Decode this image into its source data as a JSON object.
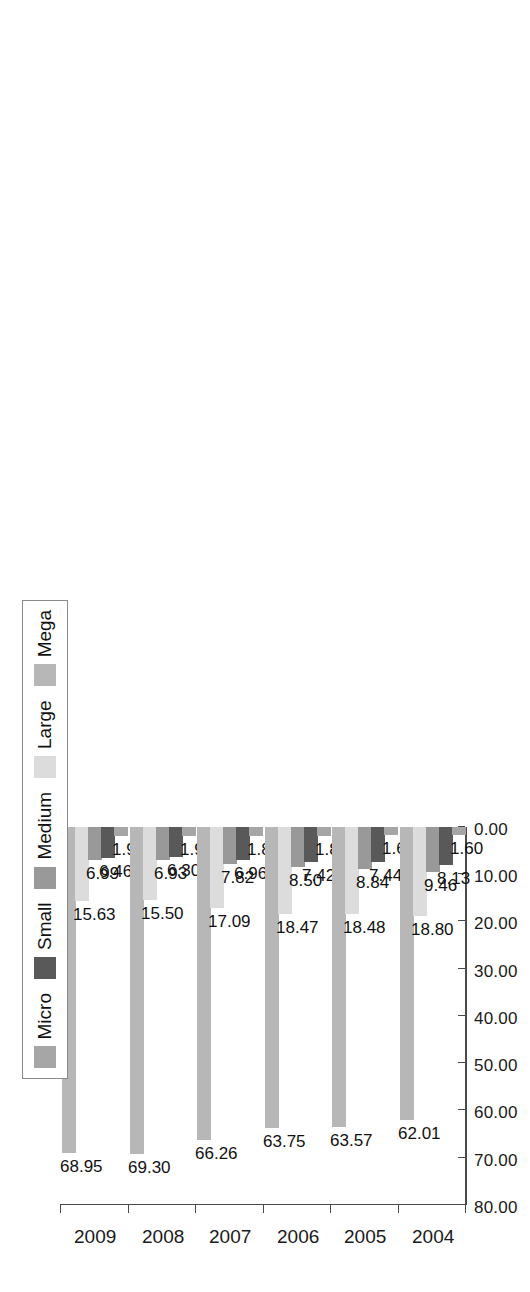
{
  "chart_data": {
    "type": "bar",
    "orientation": "horizontal",
    "title": "",
    "subtitle": "",
    "xlabel": "",
    "ylabel": "",
    "categories": [
      "2004",
      "2005",
      "2006",
      "2007",
      "2008",
      "2009"
    ],
    "category_order_top_to_bottom": [
      "2009",
      "2008",
      "2007",
      "2006",
      "2005",
      "2004"
    ],
    "series": [
      {
        "name": "Micro",
        "color": "#a6a6a6",
        "values": [
          1.6,
          1.66,
          1.87,
          1.88,
          1.96,
          1.97
        ]
      },
      {
        "name": "Small",
        "color": "#595959",
        "values": [
          8.13,
          7.44,
          7.42,
          6.96,
          6.3,
          6.46
        ]
      },
      {
        "name": "Medium",
        "color": "#999999",
        "values": [
          9.46,
          8.84,
          8.5,
          7.82,
          6.93,
          6.99
        ]
      },
      {
        "name": "Large",
        "color": "#dcdcdc",
        "values": [
          18.8,
          18.48,
          18.47,
          17.09,
          15.5,
          15.63
        ]
      },
      {
        "name": "Mega",
        "color": "#b7b7b7",
        "values": [
          62.01,
          63.57,
          63.75,
          66.26,
          69.3,
          68.95
        ]
      }
    ],
    "value_axis": {
      "min": 0,
      "max": 80,
      "step": 10,
      "tick_labels": [
        "80.00",
        "70.00",
        "60.00",
        "50.00",
        "40.00",
        "30.00",
        "20.00",
        "10.00",
        "0.00"
      ],
      "tick_values": [
        80,
        70,
        60,
        50,
        40,
        30,
        20,
        10,
        0
      ],
      "direction": "decreasing-left-to-right"
    },
    "grid": false,
    "data_labels": true,
    "data_label_format": "0.00",
    "legend": {
      "position": "left-outside",
      "entries": [
        "Micro",
        "Small",
        "Medium",
        "Large",
        "Mega"
      ]
    }
  }
}
